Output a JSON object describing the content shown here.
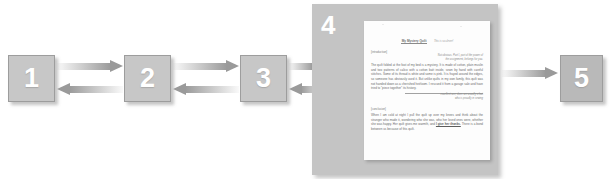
{
  "diagram": {
    "steps": [
      {
        "id": "step-1",
        "label": "1"
      },
      {
        "id": "step-2",
        "label": "2"
      },
      {
        "id": "step-3",
        "label": "3"
      },
      {
        "id": "step-4",
        "label": "4"
      },
      {
        "id": "step-5",
        "label": "5"
      }
    ],
    "connectors": [
      {
        "id": "arrow-1-to-2",
        "direction": "right"
      },
      {
        "id": "arrow-2-to-1",
        "direction": "left"
      },
      {
        "id": "arrow-2-to-3",
        "direction": "right"
      },
      {
        "id": "arrow-3-to-2",
        "direction": "left"
      },
      {
        "id": "arrow-3-to-4",
        "direction": "right"
      },
      {
        "id": "arrow-4-to-3",
        "direction": "left"
      },
      {
        "id": "arrow-4-to-5",
        "direction": "right"
      }
    ]
  },
  "document": {
    "title": "My Mystery Quilt",
    "title_note": "This is so clever!",
    "intro_tag": "[introduction]",
    "intro_annotation_line1": "Not obvious. Part I, part of the power of",
    "intro_annotation_line2": "the assignment, belongs for you.",
    "intro_paragraph": "The quilt folded at the foot of my bed is a mystery. It is made of cotton, plain muslin and two patterns of calico with a cotton batt inside, sewn by hand with careful stitches. Some of its thread is white and some is pink. It is frayed around the edges, so someone has obviously used it. But unlike quilts in my own family, this quilt was not handed down as a cherished heirloom. I rescued it from a garage sale and have tried to \"piece together\" its history.",
    "mid_annotation_line1": "excellent use, does are usually a fact",
    "mid_annotation_line2": "who is proudly in sewing",
    "conclusion_tag": "[conclusion]",
    "conclusion_paragraph_a": "When I am cold at night I pull the quilt up over my knees and think about the stranger who made it, wondering who she was, who her loved ones were, whether she was happy. Her quilt gives me warmth, and",
    "conclusion_emphasis": "I give her thanks.",
    "conclusion_paragraph_b": "There is a bond between us because of this quilt."
  }
}
